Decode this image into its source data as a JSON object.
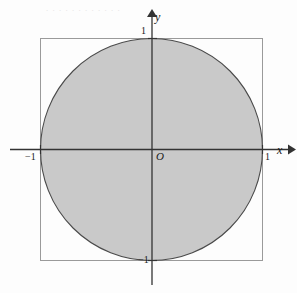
{
  "figure": {
    "background_color": "#fdfdfd"
  },
  "axes": {
    "x_label": "x",
    "y_label": "y",
    "origin_label": "O",
    "axis_color": "#333333",
    "x_axis": {
      "y_pixel": 149,
      "start_pixel": 10,
      "end_pixel": 291,
      "arrow": "right"
    },
    "y_axis": {
      "x_pixel": 152,
      "start_pixel": 283,
      "end_pixel": 14,
      "arrow": "up"
    },
    "ticks": [
      {
        "name": "x-negative-one",
        "label": "−1",
        "axis": "x",
        "value": -1
      },
      {
        "name": "x-positive-one",
        "label": "1",
        "axis": "x",
        "value": 1
      },
      {
        "name": "y-positive-one",
        "label": "1",
        "axis": "y",
        "value": 1
      },
      {
        "name": "y-negative-one",
        "label": "−1",
        "axis": "y",
        "value": -1
      }
    ]
  },
  "shapes": {
    "circle": {
      "name": "unit-disk",
      "center": [
        0,
        0
      ],
      "radius": 1,
      "center_pixel": [
        151.5,
        149
      ],
      "radius_pixel": 111,
      "fill_color": "#c9c9c9",
      "stroke_color": "#4a4a4a",
      "stroke_width": 1.1
    },
    "square": {
      "name": "bounding-square",
      "corners": [
        [
          -1,
          1
        ],
        [
          1,
          1
        ],
        [
          1,
          -1
        ],
        [
          -1,
          -1
        ]
      ],
      "x_pixel": 40.5,
      "y_pixel": 38.5,
      "side_pixel": 222,
      "fill_color": "none",
      "stroke_color": "#9a9a9a",
      "stroke_width": 1
    }
  },
  "background_artifacts": {
    "top_bleed_text": ". . . . . . . . . . . ."
  }
}
